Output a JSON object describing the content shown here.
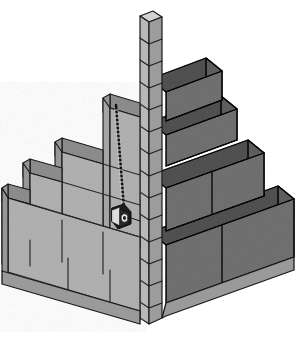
{
  "figure": {
    "title": "Masonry corner lead with story pole and tape measure",
    "background_color": "#ffffff",
    "width": 298,
    "height": 338,
    "style": "line-art technical illustration, isometric"
  },
  "palette": {
    "block_front_left": "#b2b2b2",
    "block_front_right": "#a8a8a8",
    "block_end_face": "#9a9a9a",
    "block_top_face": "#8e8e8e",
    "block_top_face_dark": "#848484",
    "pole_front": "#b8b8b8",
    "pole_side": "#9c9c9c",
    "pole_top": "#d2d2d2",
    "outline": "#1a1a1a",
    "mortar_line": "#2b2b2b",
    "reel_body": "#1c1c1c",
    "reel_highlight": "#e8e8e8",
    "tape_line": "#111111"
  },
  "parts": [
    {
      "id": "story-pole",
      "label": "Story pole / gauge rod",
      "description": "Vertical graduated pole at the corner marking course heights",
      "tick_count": 14
    },
    {
      "id": "corner-lead-left",
      "label": "Left wall lead",
      "description": "Stepped block courses racked back to the left",
      "courses": 4,
      "steps": 3
    },
    {
      "id": "corner-lead-right",
      "label": "Right wall lead",
      "description": "Stepped block courses racked back to the right",
      "courses": 4,
      "steps": 3
    },
    {
      "id": "tape-measure-line",
      "label": "Tape measure line",
      "description": "Graduated tape running vertically from top course to reel"
    },
    {
      "id": "tape-reel",
      "label": "Tape measure reel",
      "description": "Spring-return tape reel hanging against the wall face"
    }
  ],
  "annotations": {
    "visible_text": []
  }
}
